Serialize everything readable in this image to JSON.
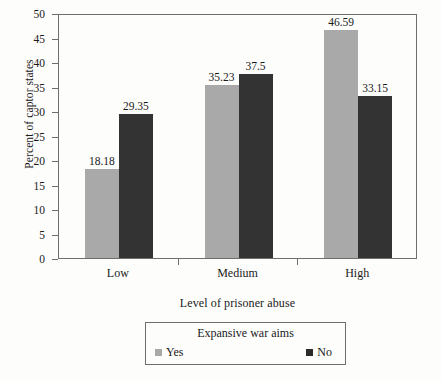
{
  "chart_data": {
    "type": "bar",
    "title": "",
    "xlabel": "Level of prisoner abuse",
    "ylabel": "Percent of captor states",
    "categories": [
      "Low",
      "Medium",
      "High"
    ],
    "series": [
      {
        "name": "Yes",
        "color": "#a9a9a9",
        "values": [
          18.18,
          35.23,
          46.59
        ]
      },
      {
        "name": "No",
        "color": "#333333",
        "values": [
          29.35,
          37.5,
          33.15
        ]
      }
    ],
    "value_labels": [
      [
        "18.18",
        "29.35"
      ],
      [
        "35.23",
        "37.5"
      ],
      [
        "46.59",
        "33.15"
      ]
    ],
    "ylim": [
      0,
      50
    ],
    "yticks": [
      0,
      5,
      10,
      15,
      20,
      25,
      30,
      35,
      40,
      45,
      50
    ],
    "ytick_labels": [
      "0",
      "5",
      "10",
      "15",
      "20",
      "25",
      "30",
      "35",
      "40",
      "45",
      "50"
    ],
    "grid": false,
    "legend": {
      "title": "Expansive war aims",
      "position": "below",
      "entries": [
        "Yes",
        "No"
      ]
    }
  }
}
